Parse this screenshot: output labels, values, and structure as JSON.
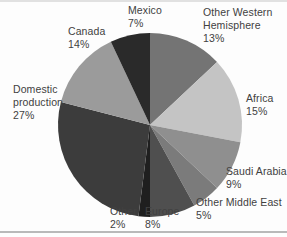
{
  "figure": {
    "background_color": "#fdfdfd",
    "label_text_color": "#414141",
    "scan_artifact_top_color": "#d9d9d9",
    "bottom_rule_color": "#b9b9b9"
  },
  "chart_data": {
    "type": "pie",
    "title": "",
    "units": "percent",
    "direction": "clockwise",
    "start_angle_deg": 0,
    "center_px": [
      150,
      125
    ],
    "radius_px": 92,
    "legend_position": "labels-around-pie",
    "categories": [
      "Other Western Hemisphere",
      "Africa",
      "Saudi Arabia",
      "Other Middle East",
      "Europe",
      "Other",
      "Domestic production",
      "Canada",
      "Mexico"
    ],
    "values": [
      13,
      15,
      9,
      5,
      8,
      2,
      27,
      14,
      7
    ],
    "slices": [
      {
        "label": "Other Western Hemisphere",
        "pct": 13,
        "color": "#747474",
        "label_lines": [
          "Other Western",
          "Hemisphere",
          "13%"
        ],
        "label_pos_px": [
          203,
          6
        ]
      },
      {
        "label": "Africa",
        "pct": 15,
        "color": "#c4c4c4",
        "label_lines": [
          "Africa",
          "15%"
        ],
        "label_pos_px": [
          246,
          92
        ]
      },
      {
        "label": "Saudi Arabia",
        "pct": 9,
        "color": "#8f8f8f",
        "label_lines": [
          "Saudi Arabia",
          "9%"
        ],
        "label_pos_px": [
          226,
          165
        ]
      },
      {
        "label": "Other Middle East",
        "pct": 5,
        "color": "#7b7b7b",
        "label_lines": [
          "Other Middle East",
          "5%"
        ],
        "label_pos_px": [
          196,
          196
        ]
      },
      {
        "label": "Europe",
        "pct": 8,
        "color": "#4f4f4f",
        "label_lines": [
          "Europe",
          "8%"
        ],
        "label_pos_px": [
          145,
          205
        ]
      },
      {
        "label": "Other",
        "pct": 2,
        "color": "#1f1f1f",
        "label_lines": [
          "Other",
          "2%"
        ],
        "label_pos_px": [
          110,
          205
        ]
      },
      {
        "label": "Domestic production",
        "pct": 27,
        "color": "#3c3c3c",
        "label_lines": [
          "Domestic",
          "production",
          "27%"
        ],
        "label_pos_px": [
          13,
          83
        ]
      },
      {
        "label": "Canada",
        "pct": 14,
        "color": "#9b9b9b",
        "label_lines": [
          "Canada",
          "14%"
        ],
        "label_pos_px": [
          68,
          25
        ]
      },
      {
        "label": "Mexico",
        "pct": 7,
        "color": "#2a2a2a",
        "label_lines": [
          "Mexico",
          "7%"
        ],
        "label_pos_px": [
          128,
          4
        ]
      }
    ]
  }
}
